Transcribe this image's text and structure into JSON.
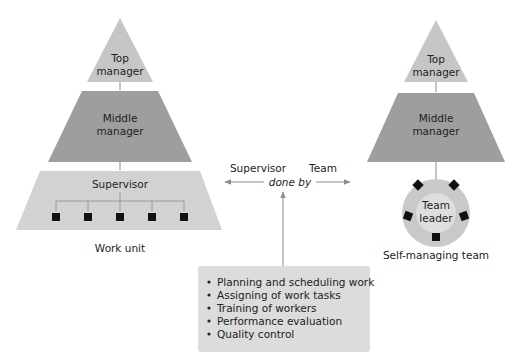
{
  "colors": {
    "top_fill": "#c6c6c6",
    "middle_fill": "#9e9e9e",
    "supervisor_fill": "#d2d2d2",
    "circle_outer": "#c9c9c9",
    "circle_inner": "#dedede",
    "box_fill": "#dcdcdc",
    "line": "#8c8c8c",
    "node": "#111111"
  },
  "left_hierarchy": {
    "top": {
      "line1": "Top",
      "line2": "manager"
    },
    "middle": {
      "line1": "Middle",
      "line2": "manager"
    },
    "supervisor": "Supervisor",
    "caption": "Work unit",
    "worker_count": 5
  },
  "right_hierarchy": {
    "top": {
      "line1": "Top",
      "line2": "manager"
    },
    "middle": {
      "line1": "Middle",
      "line2": "manager"
    },
    "team_leader": {
      "line1": "Team",
      "line2": "leader"
    },
    "caption": "Self-managing team",
    "member_count": 5
  },
  "center": {
    "left_label": "Supervisor",
    "right_label": "Team",
    "connector": "done by"
  },
  "tasks": {
    "items": [
      "Planning and scheduling work",
      "Assigning of work tasks",
      "Training of workers",
      "Performance evaluation",
      "Quality control"
    ]
  }
}
